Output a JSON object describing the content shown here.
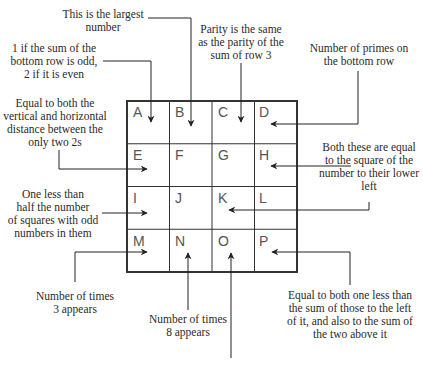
{
  "puzzle": {
    "grid": {
      "rows": 4,
      "cols": 4,
      "cells": [
        "A",
        "B",
        "C",
        "D",
        "E",
        "F",
        "G",
        "H",
        "I",
        "J",
        "K",
        "L",
        "M",
        "N",
        "O",
        "P"
      ]
    },
    "clues": {
      "B": "This is the largest number",
      "A": "1 if the sum of the bottom row is odd, 2 if it is even",
      "C": "Parity is the same as the parity of the sum of row 3",
      "D": "Number of primes on the bottom row",
      "E": "Equal to both the vertical and horizontal distance between the only two 2s",
      "HL": "Both these are equal to the square of the number to their lower left",
      "I": "One less than half the number of squares with odd numbers in them",
      "M": "Number of times 3 appears",
      "N": "Number of times 8 appears",
      "P": "Equal to both one less than the sum of those to the left of it, and also to the sum of the two above it",
      "O": ""
    },
    "clue_lines": {
      "B": [
        "This is the largest",
        "number"
      ],
      "A": [
        "1 if the sum of the",
        "bottom row is odd,",
        "2 if it is even"
      ],
      "C": [
        "Parity is the same",
        "as the parity of the",
        "sum of row 3"
      ],
      "D": [
        "Number of primes on",
        "the bottom row"
      ],
      "E": [
        "Equal to both the",
        "vertical and horizontal",
        "distance between the",
        "only two 2s"
      ],
      "HL": [
        "Both these are equal",
        "to the square of the",
        "number to their lower",
        "left"
      ],
      "I": [
        "One less than",
        "half the number",
        "of squares with odd",
        "numbers in them"
      ],
      "M": [
        "Number of times",
        "3 appears"
      ],
      "N": [
        "Number of times",
        "8 appears"
      ],
      "P": [
        "Equal to both one less than",
        "the sum of those to the left",
        "of it, and also to the sum of",
        "the two above it"
      ]
    },
    "colors": {
      "line": "#222222",
      "cell_letter": "#555555",
      "text": "#2a2a2a"
    }
  }
}
